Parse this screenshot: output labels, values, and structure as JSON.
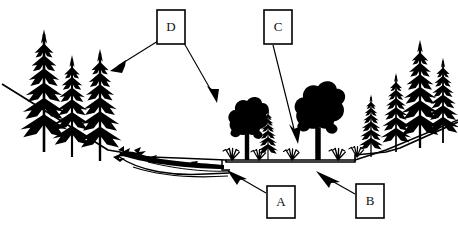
{
  "figure": {
    "type": "line-art diagram",
    "background_color": "#ffffff",
    "ink_color": "#000000",
    "width": 458,
    "height": 225
  },
  "callouts": [
    {
      "id": "callout-d",
      "label": "D",
      "box": {
        "x": 157,
        "y": 10,
        "w": 28,
        "h": 34
      },
      "leaders": [
        {
          "from": [
            157,
            40
          ],
          "to": [
            112,
            70
          ],
          "arrowhead": true
        },
        {
          "from": [
            185,
            42
          ],
          "to": [
            217,
            102
          ],
          "arrowhead": true
        }
      ]
    },
    {
      "id": "callout-c",
      "label": "C",
      "box": {
        "x": 264,
        "y": 10,
        "w": 28,
        "h": 34
      },
      "leaders": [
        {
          "from": [
            272,
            44
          ],
          "to": [
            298,
            142
          ],
          "arrowhead": true
        }
      ]
    },
    {
      "id": "callout-a",
      "label": "A",
      "box": {
        "x": 267,
        "y": 186,
        "w": 28,
        "h": 32
      },
      "leaders": [
        {
          "from": [
            267,
            192
          ],
          "to": [
            229,
            172
          ],
          "arrowhead": true
        }
      ]
    },
    {
      "id": "callout-b",
      "label": "B",
      "box": {
        "x": 356,
        "y": 184,
        "w": 28,
        "h": 34
      },
      "leaders": [
        {
          "from": [
            356,
            192
          ],
          "to": [
            318,
            172
          ],
          "arrowhead": true
        }
      ]
    }
  ],
  "scene_elements": {
    "terrain_name": "valley-cross-section-ground-line",
    "left_slope": "descending slope from upper-left to valley floor",
    "valley_floor": "flat stream bench at center",
    "right_slope": "ascending slope to upper-right",
    "stream_channel": "lower water / channel line beneath the bench",
    "beaver_dam": "dark woody debris / dam structure on the left slope toe"
  },
  "vegetation": {
    "left_conifers": [
      {
        "x": 44,
        "base_y": 152,
        "height": 118,
        "trunk_w": 3
      },
      {
        "x": 71,
        "base_y": 156,
        "height": 98,
        "trunk_w": 3
      },
      {
        "x": 99,
        "base_y": 160,
        "height": 108,
        "trunk_w": 3
      }
    ],
    "center_deciduous": [
      {
        "x": 247,
        "base_y": 160,
        "height": 60,
        "crown_w": 34
      },
      {
        "x": 318,
        "base_y": 160,
        "height": 72,
        "crown_w": 42
      }
    ],
    "center_conifers": [
      {
        "x": 268,
        "base_y": 160,
        "height": 52,
        "trunk_w": 2
      }
    ],
    "grass_tufts": [
      {
        "x": 232,
        "base_y": 160
      },
      {
        "x": 258,
        "base_y": 160
      },
      {
        "x": 291,
        "base_y": 160
      },
      {
        "x": 337,
        "base_y": 160
      },
      {
        "x": 356,
        "base_y": 160
      }
    ],
    "right_conifers": [
      {
        "x": 371,
        "base_y": 158,
        "height": 62,
        "trunk_w": 2
      },
      {
        "x": 396,
        "base_y": 152,
        "height": 78,
        "trunk_w": 2
      },
      {
        "x": 420,
        "base_y": 148,
        "height": 104,
        "trunk_w": 4
      },
      {
        "x": 442,
        "base_y": 143,
        "height": 82,
        "trunk_w": 3
      }
    ]
  }
}
